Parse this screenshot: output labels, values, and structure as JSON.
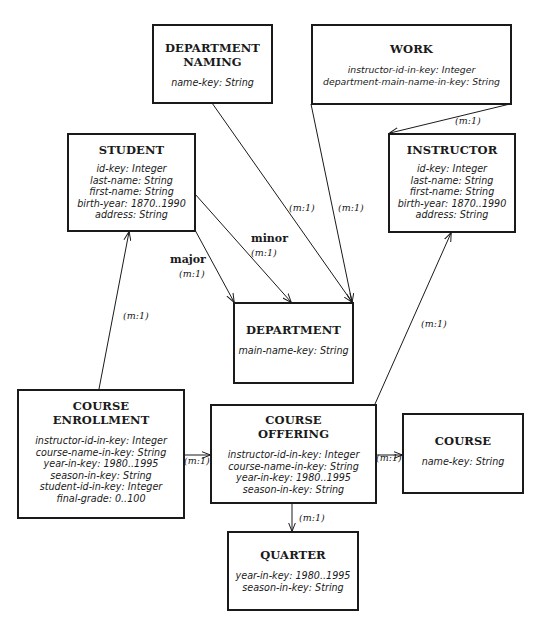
{
  "entities": {
    "department_naming": {
      "title_lines": [
        "DEPARTMENT",
        "NAMING"
      ],
      "attributes": [
        "name-key: String"
      ]
    },
    "work": {
      "title_lines": [
        "WORK"
      ],
      "attributes": [
        "instructor-id-in-key: Integer",
        "department-main-name-in-key: String"
      ]
    },
    "student": {
      "title_lines": [
        "STUDENT"
      ],
      "attributes": [
        "id-key: Integer",
        "last-name: String",
        "first-name: String",
        "birth-year: 1870..1990",
        "address: String"
      ]
    },
    "instructor": {
      "title_lines": [
        "INSTRUCTOR"
      ],
      "attributes": [
        "id-key: Integer",
        "last-name: String",
        "first-name: String",
        "birth-year: 1870..1990",
        "address: String"
      ]
    },
    "department": {
      "title_lines": [
        "DEPARTMENT"
      ],
      "attributes": [
        "main-name-key: String"
      ]
    },
    "course_enrollment": {
      "title_lines": [
        "COURSE",
        "ENROLLMENT"
      ],
      "attributes": [
        "instructor-id-in-key: Integer",
        "course-name-in-key: String",
        "year-in-key: 1980..1995",
        "season-in-key: String",
        "student-id-in-key: Integer",
        "final-grade: 0..100"
      ]
    },
    "course_offering": {
      "title_lines": [
        "COURSE",
        "OFFERING"
      ],
      "attributes": [
        "instructor-id-in-key: Integer",
        "course-name-in-key: String",
        "year-in-key: 1980..1995",
        "season-in-key: String"
      ]
    },
    "course": {
      "title_lines": [
        "COURSE"
      ],
      "attributes": [
        "name-key: String"
      ]
    },
    "quarter": {
      "title_lines": [
        "QUARTER"
      ],
      "attributes": [
        "year-in-key: 1980..1995",
        "season-in-key: String"
      ]
    }
  },
  "relationships": {
    "work_instructor": {
      "cardinality": "(m:1)"
    },
    "deptnaming_department": {
      "cardinality": "(m:1)"
    },
    "work_department": {
      "cardinality": "(m:1)"
    },
    "student_major": {
      "role": "major",
      "cardinality": "(m:1)"
    },
    "student_minor": {
      "role": "minor",
      "cardinality": "(m:1)"
    },
    "enrollment_student": {
      "cardinality": "(m:1)"
    },
    "offering_instructor": {
      "cardinality": "(m:1)"
    },
    "enrollment_offering": {
      "cardinality": "(m:1)"
    },
    "offering_course": {
      "cardinality": "(m:1)"
    },
    "offering_quarter": {
      "cardinality": "(m:1)"
    }
  }
}
